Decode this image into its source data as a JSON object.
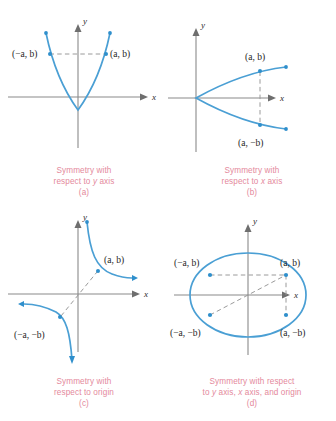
{
  "figure": {
    "accent_curve_color": "#4a9fd4",
    "caption_color": "#e4899c",
    "axis_color": "#8a8a8a",
    "dash_color": "#9a9a9a"
  },
  "panels": [
    {
      "id": "a",
      "index_label": "(a)",
      "caption_line1": "Symmetry with",
      "caption_line2_pre": "respect to ",
      "caption_line2_var": "y",
      "caption_line2_post": " axis",
      "x_axis_label": "x",
      "y_axis_label": "y",
      "curve_type": "parabola-up",
      "points": [
        {
          "label_open": "(−",
          "label_a": "a",
          "label_mid": ", ",
          "label_b": "b",
          "label_close": ")",
          "text": "(−a, b)"
        },
        {
          "label_open": "(",
          "label_a": "a",
          "label_mid": ", ",
          "label_b": "b",
          "label_close": ")",
          "text": "(a, b)"
        }
      ],
      "construction": "horizontal dashed segment joining (−a, b) and (a, b)"
    },
    {
      "id": "b",
      "index_label": "(b)",
      "caption_line1": "Symmetry with",
      "caption_line2_pre": "respect to ",
      "caption_line2_var": "x",
      "caption_line2_post": " axis",
      "x_axis_label": "x",
      "y_axis_label": "y",
      "curve_type": "parabola-right",
      "points": [
        {
          "text": "(a, b)"
        },
        {
          "text": "(a, −b)"
        }
      ],
      "construction": "vertical dashed segment joining (a, b) and (a, −b)"
    },
    {
      "id": "c",
      "index_label": "(c)",
      "caption_line1": "Symmetry with",
      "caption_line2_pre": "respect to origin",
      "caption_line2_var": "",
      "caption_line2_post": "",
      "x_axis_label": "x",
      "y_axis_label": "y",
      "curve_type": "hyperbola",
      "points": [
        {
          "text": "(a, b)"
        },
        {
          "text": "(−a, −b)"
        }
      ],
      "construction": "diagonal dashed segment through origin joining (a, b) and (−a, −b)"
    },
    {
      "id": "d",
      "index_label": "(d)",
      "caption_line1": "Symmetry with respect",
      "caption_line2_pre": "to ",
      "caption_line2_var": "y",
      "caption_line2_mid": " axis, ",
      "caption_line2_var2": "x",
      "caption_line2_post": " axis, and origin",
      "x_axis_label": "x",
      "y_axis_label": "y",
      "curve_type": "ellipse",
      "points": [
        {
          "text": "(−a, b)"
        },
        {
          "text": "(a, b)"
        },
        {
          "text": "(−a, −b)"
        },
        {
          "text": "(a, −b)"
        }
      ],
      "construction": "horizontal, vertical and diagonal dashed segments joining the four labelled points"
    }
  ]
}
